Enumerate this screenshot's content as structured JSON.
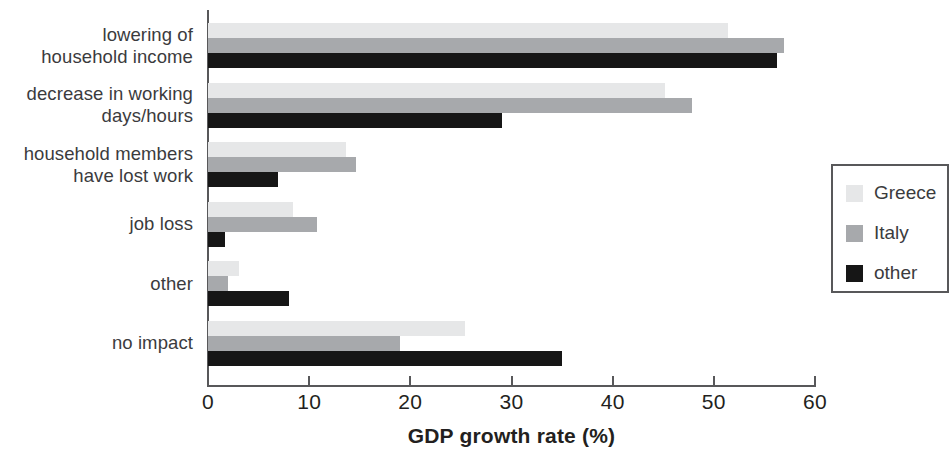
{
  "chart_data": {
    "type": "bar",
    "orientation": "horizontal",
    "title": "",
    "xlabel": "GDP growth rate (%)",
    "ylabel": "",
    "xlim": [
      0,
      60
    ],
    "xticks": [
      0,
      10,
      20,
      30,
      40,
      50,
      60
    ],
    "xtick_labels": [
      "0",
      "10",
      "20",
      "30",
      "40",
      "50",
      "60"
    ],
    "grid": false,
    "legend_position": "right",
    "categories": [
      "lowering of\nhousehold income",
      "decrease in working\ndays/hours",
      "household members\nhave lost work",
      "job loss",
      "other",
      "no impact"
    ],
    "series": [
      {
        "name": "Greece",
        "color": "#e6e7e8",
        "values": [
          51.4,
          45.2,
          13.6,
          8.4,
          3.1,
          25.4
        ]
      },
      {
        "name": "Italy",
        "color": "#a7a9ac",
        "values": [
          56.9,
          47.8,
          14.6,
          10.8,
          2.0,
          19.0
        ]
      },
      {
        "name": "other",
        "color": "#161616",
        "values": [
          56.2,
          29.1,
          6.9,
          1.7,
          8.0,
          35.0
        ]
      }
    ]
  },
  "axis": {
    "x_title": "GDP growth rate (%)",
    "tick_0": "0",
    "tick_10": "10",
    "tick_20": "20",
    "tick_30": "30",
    "tick_40": "40",
    "tick_50": "50",
    "tick_60": "60"
  },
  "categories": {
    "c0": "lowering of\nhousehold income",
    "c1": "decrease in working\ndays/hours",
    "c2": "household members\nhave lost work",
    "c3": "job loss",
    "c4": "other",
    "c5": "no impact"
  },
  "legend": {
    "items": [
      {
        "label": "Greece",
        "color": "#e6e7e8"
      },
      {
        "label": "Italy",
        "color": "#a7a9ac"
      },
      {
        "label": "other",
        "color": "#161616"
      }
    ]
  },
  "colors": {
    "greece": "#e6e7e8",
    "italy": "#a7a9ac",
    "other": "#161616",
    "axis": "#58585a",
    "text": "#231f20",
    "background": "#ffffff"
  }
}
